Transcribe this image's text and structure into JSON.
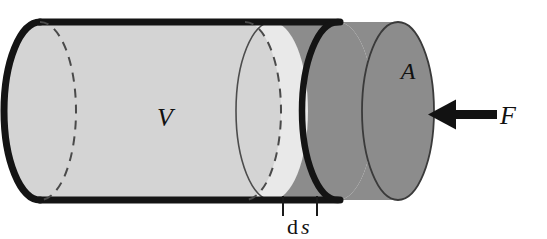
{
  "figure": {
    "name": "work-done-on-gas-cylinder-diagram",
    "background_color": "#ffffff"
  },
  "labels": {
    "volume": "V",
    "area": "A",
    "force": "F",
    "displacement_d": "d",
    "displacement_s": "s"
  },
  "colors": {
    "body_light_gray": "#d4d4d4",
    "slab_very_light_gray": "#e9e9e9",
    "piston_dark_gray": "#8c8c8c",
    "outline_black": "#141414",
    "thin_outline": "#3a3a3a",
    "dashed_hidden_edge": "#4a4a4a",
    "arrow_black": "#121212",
    "label_black": "#111111"
  },
  "geometry": {
    "cylinder_top_y": 22,
    "cylinder_bottom_y": 200,
    "left_cap_center_x": 40,
    "back_dashed_ellipse_x": 107,
    "mid_dashed_ellipse_x": 245,
    "slab_front_x": 272,
    "thick_arc_x": 338,
    "right_cap_center_x": 398,
    "ellipse_rx": 36,
    "ellipse_ry": 89,
    "outline_width_thick": 7,
    "outline_width_thin": 2
  },
  "arrow": {
    "name": "force-arrow",
    "direction": "left",
    "tip_x": 428,
    "tail_x": 497,
    "y": 114,
    "shaft_thickness": 9,
    "head_length": 24,
    "head_half_height": 15
  },
  "ds_marker": {
    "tick_left_x": 283,
    "tick_right_x": 317,
    "tick_top_y": 196,
    "tick_bottom_y": 214,
    "label_x": 287,
    "label_y": 234
  },
  "label_positions": {
    "volume_x": 165,
    "volume_y": 126,
    "area_x": 408,
    "area_y": 79,
    "force_x": 508,
    "force_y": 124
  }
}
